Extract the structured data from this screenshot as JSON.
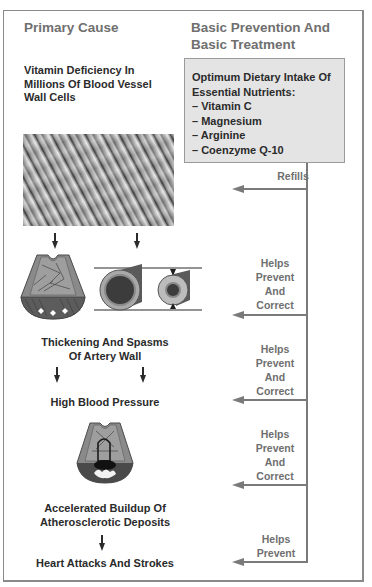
{
  "headers": {
    "left": "Primary Cause",
    "right_line1": "Basic Prevention And",
    "right_line2": "Basic Treatment"
  },
  "cause_chain": {
    "step1": [
      "Vitamin Deficiency In",
      "Millions Of Blood Vessel",
      "Wall Cells"
    ],
    "step2": [
      "Thickening And Spasms",
      "Of Artery Wall"
    ],
    "step3": [
      "High Blood Pressure"
    ],
    "step4": [
      "Accelerated Buildup Of",
      "Atherosclerotic Deposits"
    ],
    "step5": [
      "Heart Attacks And Strokes"
    ]
  },
  "illustrations": {
    "photo": "vessel-wall-cells-micrograph",
    "artery_section_1": "artery-wall-cross-section",
    "artery_tubes": "artery-normal-vs-constricted",
    "artery_section_2": "artery-atherosclerotic-deposit"
  },
  "treatment_box": {
    "title_line1": "Optimum Dietary Intake Of",
    "title_line2": "Essential Nutrients:",
    "nutrients": [
      "– Vitamin C",
      "– Magnesium",
      "– Arginine",
      "– Coenzyme Q-10"
    ]
  },
  "connectors": [
    {
      "lines": [
        "Refills"
      ]
    },
    {
      "lines": [
        "Helps",
        "Prevent",
        "And",
        "Correct"
      ]
    },
    {
      "lines": [
        "Helps",
        "Prevent",
        "And",
        "Correct"
      ]
    },
    {
      "lines": [
        "Helps",
        "Prevent",
        "And",
        "Correct"
      ]
    },
    {
      "lines": [
        "Helps",
        "Prevent"
      ]
    }
  ],
  "colors": {
    "header_text": "#6f6f6f",
    "body_text": "#2b2b2b",
    "box_fill": "#e4e4e4",
    "connector": "#7a7a7a"
  }
}
